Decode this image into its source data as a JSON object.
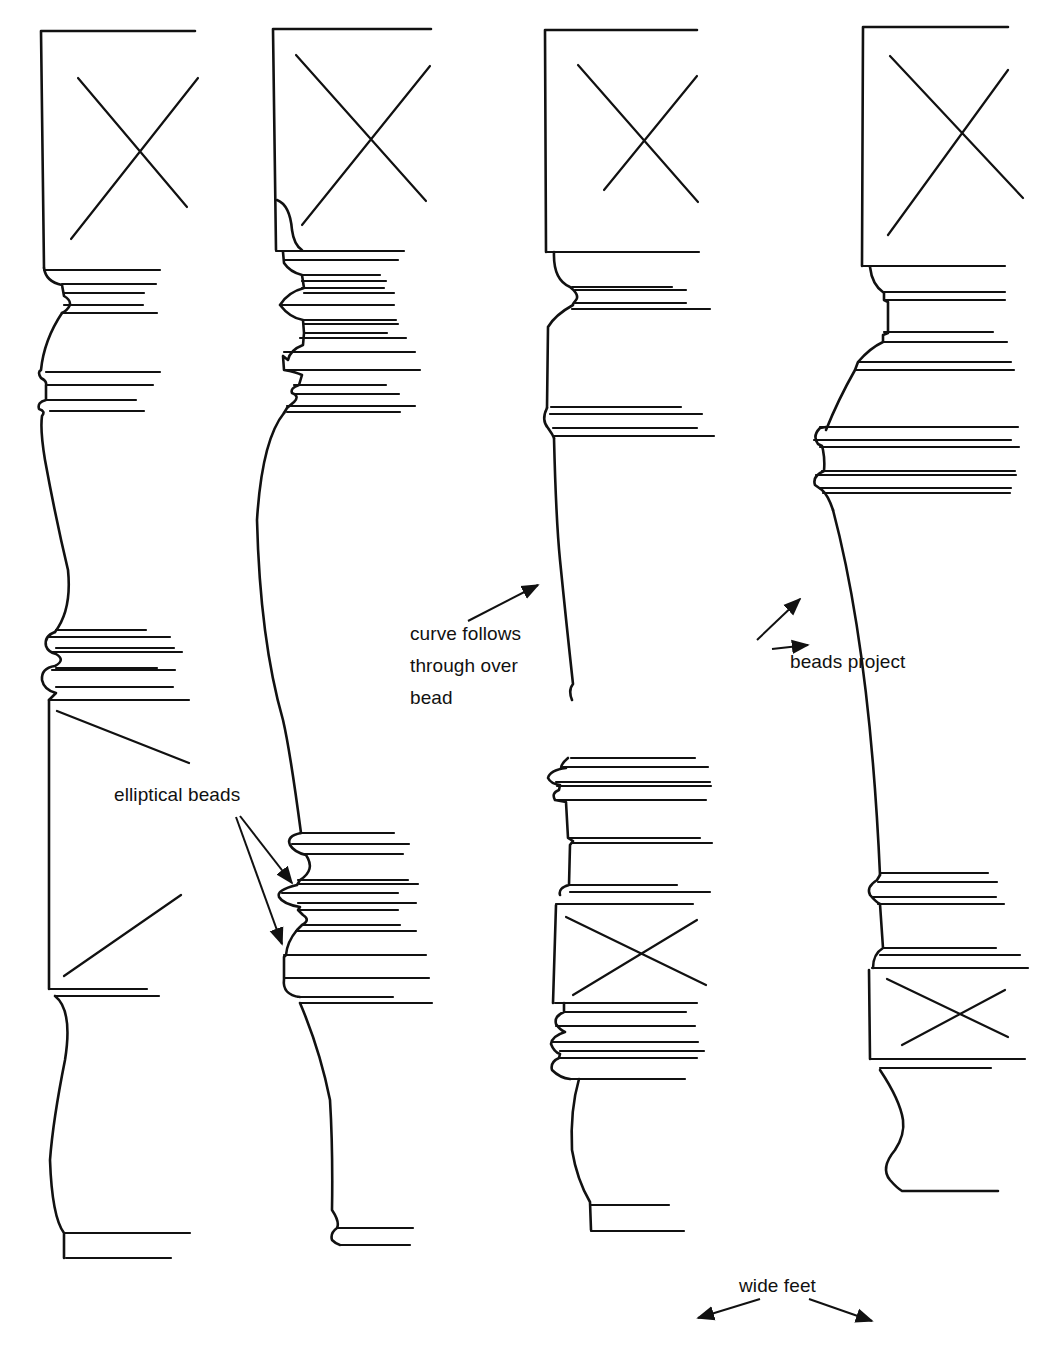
{
  "figure": {
    "legs": [
      {
        "id": "leg-1",
        "description": "Square top pommel, rounded coves, elliptical bead pair, square middle block, plain foot"
      },
      {
        "id": "leg-2",
        "description": "Square top pommel with many fillets and beads, long taper, elliptical beads, bead foot"
      },
      {
        "id": "leg-3",
        "description": "Square top pommel, curve follows through over bead, square middle block, wide foot"
      },
      {
        "id": "leg-4",
        "description": "Square top pommel, projecting beads, long taper, square middle block, wide foot"
      }
    ],
    "annotations": [
      {
        "id": "curve-follows",
        "text": "curve follows\nthrough over\nbead"
      },
      {
        "id": "beads-project",
        "text": "beads project"
      },
      {
        "id": "elliptical-beads",
        "text": "elliptical beads"
      },
      {
        "id": "wide-feet",
        "text": "wide feet"
      }
    ]
  },
  "colors": {
    "ink": "#111111",
    "paper": "#ffffff"
  }
}
